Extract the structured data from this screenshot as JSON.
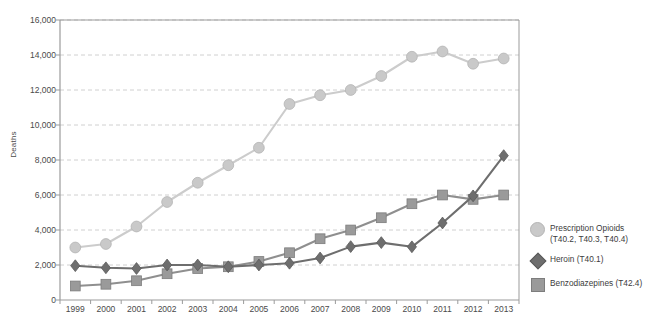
{
  "chart_data": {
    "type": "line",
    "title": "",
    "xlabel": "",
    "ylabel": "Deaths",
    "categories": [
      1999,
      2000,
      2001,
      2002,
      2003,
      2004,
      2005,
      2006,
      2007,
      2008,
      2009,
      2010,
      2011,
      2012,
      2013
    ],
    "xtick_labels": [
      "1999",
      "2000",
      "2001",
      "2002",
      "2003",
      "2004",
      "2005",
      "2006",
      "2007",
      "2008",
      "2009",
      "2010",
      "2011",
      "2012",
      "2013"
    ],
    "ytick_labels": [
      "0",
      "2,000",
      "4,000",
      "6,000",
      "8,000",
      "10,000",
      "12,000",
      "14,000",
      "16,000"
    ],
    "ytick_values": [
      0,
      2000,
      4000,
      6000,
      8000,
      10000,
      12000,
      14000,
      16000
    ],
    "ylim": [
      0,
      16000
    ],
    "grid": true,
    "grid_style": "dashed-horizontal",
    "legend_position": "right",
    "series": [
      {
        "name": "Prescription Opioids\n(T40.2, T40.3, T40.4)",
        "marker": "circle",
        "color": "#c9c9c9",
        "line_color": "#cccccc",
        "values": [
          3000,
          3200,
          4200,
          5600,
          6700,
          7700,
          8700,
          11200,
          11700,
          12000,
          12800,
          13900,
          14200,
          13500,
          13800
        ]
      },
      {
        "name": "Heroin (T40.1)",
        "marker": "diamond",
        "color": "#6e6e6e",
        "line_color": "#6e6e6e",
        "values": [
          1960,
          1840,
          1800,
          2000,
          2000,
          1900,
          2000,
          2100,
          2400,
          3050,
          3280,
          3040,
          4400,
          5950,
          8250
        ]
      },
      {
        "name": "Benzodiazepines (T42.4)",
        "marker": "square",
        "color": "#9a9a9a",
        "line_color": "#8f8f8f",
        "values": [
          800,
          900,
          1100,
          1500,
          1800,
          1900,
          2200,
          2700,
          3500,
          4000,
          4700,
          5500,
          6000,
          5750,
          6000
        ]
      }
    ]
  },
  "legend": [
    {
      "label": "Prescription Opioids\n(T40.2, T40.3, T40.4)",
      "marker": "circle-marker"
    },
    {
      "label": "Heroin (T40.1)",
      "marker": "diamond-marker"
    },
    {
      "label": "Benzodiazepines (T42.4)",
      "marker": "square-marker"
    }
  ],
  "colors": {
    "opioids": "#c9c9c9",
    "heroin": "#6e6e6e",
    "benzodiazepines": "#9a9a9a",
    "axis": "#9b9b9b",
    "grid": "#c4c4c4",
    "text": "#3c3c3c"
  }
}
